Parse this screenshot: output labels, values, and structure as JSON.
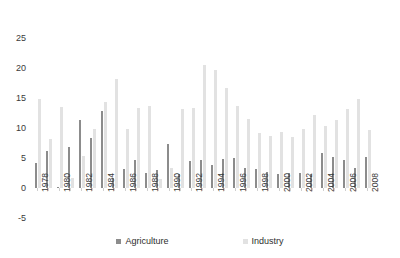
{
  "chart_data": {
    "type": "bar",
    "title": "",
    "xlabel": "",
    "ylabel": "",
    "ylim": [
      -5,
      25
    ],
    "yticks": [
      25,
      20,
      15,
      10,
      5,
      0,
      -5
    ],
    "grid": false,
    "legend_position": "bottom",
    "categories": [
      "1978",
      "1979",
      "1980",
      "1981",
      "1982",
      "1983",
      "1984",
      "1985",
      "1986",
      "1987",
      "1988",
      "1989",
      "1990",
      "1991",
      "1992",
      "1993",
      "1994",
      "1995",
      "1996",
      "1997",
      "1998",
      "1999",
      "2000",
      "2001",
      "2002",
      "2003",
      "2004",
      "2005",
      "2006",
      "2007",
      "2008",
      "2009"
    ],
    "tick_labels": [
      "1978",
      "1980",
      "1982",
      "1984",
      "1986",
      "1988",
      "1990",
      "1992",
      "1994",
      "1996",
      "1998",
      "2000",
      "2002",
      "2004",
      "2006",
      "2008"
    ],
    "series": [
      {
        "name": "Agriculture",
        "color": "#8c8c8c",
        "values": [
          4.1,
          6.1,
          0.2,
          6.9,
          11.4,
          8.3,
          12.9,
          1.7,
          3.2,
          4.7,
          2.5,
          3.0,
          7.3,
          2.3,
          4.5,
          4.6,
          3.8,
          4.8,
          5.0,
          3.4,
          3.2,
          2.6,
          2.4,
          2.5,
          2.5,
          2.3,
          5.9,
          5.1,
          4.6,
          3.3,
          5.1,
          0.0
        ]
      },
      {
        "name": "Industry",
        "color": "#e2e2e2",
        "values": [
          14.8,
          8.1,
          13.5,
          1.7,
          5.3,
          9.8,
          14.3,
          18.2,
          9.9,
          13.4,
          13.6,
          1.5,
          3.4,
          13.1,
          13.4,
          20.5,
          19.7,
          16.6,
          13.6,
          11.5,
          9.2,
          8.7,
          9.4,
          8.5,
          9.8,
          12.1,
          10.3,
          11.3,
          13.2,
          14.8,
          9.7,
          0.0
        ]
      }
    ]
  },
  "legend": {
    "items": [
      {
        "label": "Agriculture",
        "icon": "square-swatch-icon"
      },
      {
        "label": "Industry",
        "icon": "square-swatch-icon"
      }
    ]
  }
}
